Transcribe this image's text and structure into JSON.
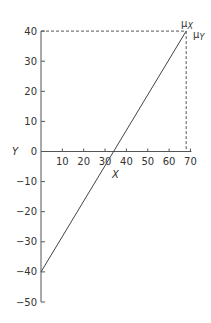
{
  "chart_data": {
    "type": "line",
    "title": "",
    "xlabel": "X",
    "ylabel": "Y",
    "x_ticks": [
      10,
      20,
      30,
      40,
      50,
      60,
      70
    ],
    "y_ticks": [
      40,
      30,
      20,
      10,
      0,
      -10,
      -20,
      -30,
      -40,
      -50
    ],
    "xlim": [
      0,
      70
    ],
    "ylim": [
      -50,
      40
    ],
    "grid": false,
    "series": [
      {
        "name": "regression line",
        "x": [
          0,
          68
        ],
        "y": [
          -40,
          40
        ]
      }
    ],
    "annotations": [
      {
        "label": "μX",
        "x": 68,
        "y": 40,
        "note": "dashed vertical guide at mean of X"
      },
      {
        "label": "μY",
        "x": 68,
        "y": 40,
        "note": "dashed horizontal guide at mean of Y"
      }
    ]
  },
  "labels": {
    "x_axis": "X",
    "y_axis": "Y",
    "mu": "μ",
    "mu_x_sub": "X",
    "mu_y_sub": "Y"
  }
}
